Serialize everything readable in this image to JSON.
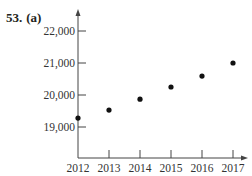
{
  "problem": {
    "number": "53.",
    "part": "(a)"
  },
  "chart_data": {
    "type": "scatter",
    "title": "",
    "xlabel": "",
    "ylabel": "",
    "x": [
      2012,
      2013,
      2014,
      2015,
      2016,
      2017
    ],
    "y": [
      19280,
      19530,
      19870,
      20250,
      20590,
      21000
    ],
    "x_ticks": [
      "2012",
      "2013",
      "2014",
      "2015",
      "2016",
      "2017"
    ],
    "y_ticks": [
      "19,000",
      "20,000",
      "21,000",
      "22,000"
    ],
    "y_tick_values": [
      19000,
      20000,
      21000,
      22000
    ],
    "xlim": [
      2012,
      2017.4
    ],
    "ylim": [
      18000,
      22400
    ],
    "grid": false,
    "legend": null
  },
  "colors": {
    "axis": "#444444",
    "point": "#111111",
    "text": "#333333"
  }
}
